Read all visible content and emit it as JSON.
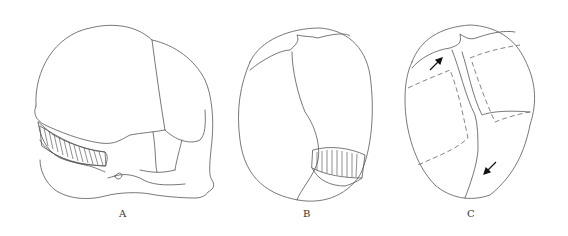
{
  "figure": {
    "panels": [
      {
        "id": "A",
        "label": "A",
        "view": "lateral skull with hatched band"
      },
      {
        "id": "B",
        "label": "B",
        "view": "posterior skull with hatched band"
      },
      {
        "id": "C",
        "label": "C",
        "view": "superior skull with dashed regions and arrows"
      }
    ],
    "colors": {
      "line": "#555555",
      "background": "#ffffff",
      "arrow": "#111111"
    }
  }
}
